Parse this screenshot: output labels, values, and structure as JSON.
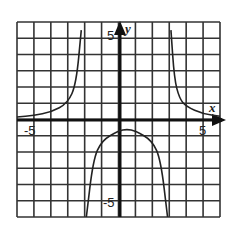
{
  "chart_data": {
    "type": "line",
    "title": "",
    "xlabel": "x",
    "ylabel": "y",
    "xlim": [
      -6,
      6
    ],
    "ylim": [
      -6,
      6
    ],
    "grid": true,
    "tick_labels": {
      "x": [
        "-5",
        "5"
      ],
      "y": [
        "5",
        "-5"
      ]
    },
    "vertical_asymptotes": [
      -2,
      3
    ],
    "horizontal_asymptote": 0,
    "series": [
      {
        "name": "left branch",
        "x": [
          -6,
          -5,
          -4,
          -3,
          -2.5,
          -2.2
        ],
        "y": [
          0.15,
          0.25,
          0.45,
          1.0,
          2.2,
          5.5
        ]
      },
      {
        "name": "middle branch",
        "x": [
          -1.9,
          -1.5,
          -1,
          0,
          0.5,
          1,
          2,
          2.5,
          2.9
        ],
        "y": [
          -6,
          -2.5,
          -1.3,
          -0.7,
          -0.6,
          -0.7,
          -1.3,
          -2.5,
          -6
        ]
      },
      {
        "name": "right branch",
        "x": [
          3.1,
          3.3,
          3.6,
          4,
          5,
          6
        ],
        "y": [
          5.5,
          2.5,
          1.3,
          0.8,
          0.35,
          0.2
        ]
      }
    ]
  },
  "labels": {
    "x_axis": "x",
    "y_axis": "y",
    "x_neg": "-5",
    "x_pos": "5",
    "y_pos": "5",
    "y_neg": "-5"
  }
}
